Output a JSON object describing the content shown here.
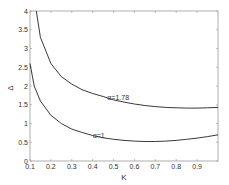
{
  "chart_data": {
    "type": "line",
    "title": "",
    "xlabel": "K",
    "ylabel": "Δ",
    "xlim": [
      0.1,
      1.0
    ],
    "ylim": [
      0,
      4
    ],
    "xticks": [
      "0.1",
      "0.2",
      "0.3",
      "0.4",
      "0.5",
      "0.6",
      "0.7",
      "0.8",
      "0.9"
    ],
    "yticks": [
      "0",
      "0.5",
      "1",
      "1.5",
      "2",
      "2.5",
      "3",
      "3.5",
      "4"
    ],
    "grid": false,
    "legend": "none",
    "series": [
      {
        "name": "α=1.78",
        "annotation": "α=1.78",
        "annotation_at": [
          0.47,
          1.7
        ],
        "x": [
          0.13,
          0.15,
          0.2,
          0.25,
          0.3,
          0.35,
          0.4,
          0.45,
          0.5,
          0.55,
          0.6,
          0.65,
          0.7,
          0.75,
          0.8,
          0.85,
          0.9,
          0.95,
          1.0
        ],
        "y": [
          4.0,
          3.3,
          2.6,
          2.25,
          2.05,
          1.9,
          1.8,
          1.72,
          1.63,
          1.57,
          1.52,
          1.48,
          1.45,
          1.43,
          1.42,
          1.41,
          1.41,
          1.42,
          1.43
        ]
      },
      {
        "name": "α=1",
        "annotation": "α=1",
        "annotation_at": [
          0.4,
          0.68
        ],
        "x": [
          0.1,
          0.12,
          0.15,
          0.2,
          0.25,
          0.3,
          0.35,
          0.4,
          0.45,
          0.5,
          0.55,
          0.6,
          0.65,
          0.7,
          0.75,
          0.8,
          0.85,
          0.9,
          0.95,
          1.0
        ],
        "y": [
          2.6,
          2.0,
          1.6,
          1.22,
          1.0,
          0.85,
          0.76,
          0.68,
          0.62,
          0.58,
          0.55,
          0.53,
          0.52,
          0.52,
          0.53,
          0.55,
          0.58,
          0.61,
          0.65,
          0.7
        ]
      }
    ]
  }
}
